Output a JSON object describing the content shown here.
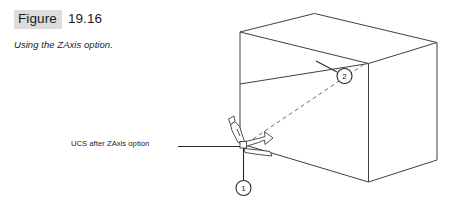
{
  "figure": {
    "label": "Figure",
    "number": "19.16",
    "subtitle": "Using the ZAxis option.",
    "label_background": "#dcdcdc"
  },
  "annotations": {
    "ucs_label": "UCS after ZAxis option"
  },
  "callouts": [
    {
      "id": "callout-2",
      "text": "2"
    },
    {
      "id": "callout-1",
      "text": "1"
    }
  ],
  "diagram": {
    "background": "#ffffff",
    "line_color": "#404040",
    "dashed_line_color": "#6e6e6e"
  }
}
